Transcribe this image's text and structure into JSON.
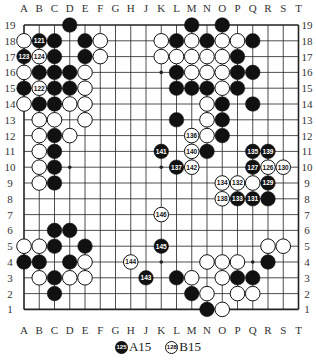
{
  "board": {
    "size": 19,
    "columns": [
      "A",
      "B",
      "C",
      "D",
      "E",
      "F",
      "G",
      "H",
      "J",
      "K",
      "L",
      "M",
      "N",
      "O",
      "P",
      "Q",
      "R",
      "S",
      "T"
    ],
    "rows": [
      19,
      18,
      17,
      16,
      15,
      14,
      13,
      12,
      11,
      10,
      9,
      8,
      7,
      6,
      5,
      4,
      3,
      2,
      1
    ],
    "star_points": [
      "D16",
      "K16",
      "Q16",
      "D10",
      "K10",
      "Q10",
      "D4",
      "K4",
      "Q4"
    ],
    "line_color": "#222222",
    "stones": [
      {
        "pos": "D19",
        "color": "black"
      },
      {
        "pos": "M19",
        "color": "black"
      },
      {
        "pos": "O19",
        "color": "black"
      },
      {
        "pos": "A18",
        "color": "white"
      },
      {
        "pos": "B18",
        "color": "black",
        "label": "121"
      },
      {
        "pos": "C18",
        "color": "black"
      },
      {
        "pos": "E18",
        "color": "black"
      },
      {
        "pos": "F18",
        "color": "white"
      },
      {
        "pos": "K18",
        "color": "white"
      },
      {
        "pos": "L18",
        "color": "black"
      },
      {
        "pos": "M18",
        "color": "white"
      },
      {
        "pos": "N18",
        "color": "black"
      },
      {
        "pos": "O18",
        "color": "white"
      },
      {
        "pos": "P18",
        "color": "white"
      },
      {
        "pos": "Q18",
        "color": "black"
      },
      {
        "pos": "A17",
        "color": "black",
        "label": "123"
      },
      {
        "pos": "B17",
        "color": "white",
        "label": "124"
      },
      {
        "pos": "C17",
        "color": "black"
      },
      {
        "pos": "E17",
        "color": "black"
      },
      {
        "pos": "F17",
        "color": "white"
      },
      {
        "pos": "K17",
        "color": "white"
      },
      {
        "pos": "L17",
        "color": "white"
      },
      {
        "pos": "M17",
        "color": "white"
      },
      {
        "pos": "N17",
        "color": "white"
      },
      {
        "pos": "O17",
        "color": "white"
      },
      {
        "pos": "P17",
        "color": "black"
      },
      {
        "pos": "A16",
        "color": "white"
      },
      {
        "pos": "B16",
        "color": "black"
      },
      {
        "pos": "C16",
        "color": "black"
      },
      {
        "pos": "D16",
        "color": "black"
      },
      {
        "pos": "E16",
        "color": "white"
      },
      {
        "pos": "L16",
        "color": "black"
      },
      {
        "pos": "M16",
        "color": "white"
      },
      {
        "pos": "N16",
        "color": "white"
      },
      {
        "pos": "O16",
        "color": "white"
      },
      {
        "pos": "P16",
        "color": "black"
      },
      {
        "pos": "Q16",
        "color": "black"
      },
      {
        "pos": "A15",
        "color": "black"
      },
      {
        "pos": "B15",
        "color": "white",
        "label": "122"
      },
      {
        "pos": "C15",
        "color": "black"
      },
      {
        "pos": "D15",
        "color": "black"
      },
      {
        "pos": "E15",
        "color": "white"
      },
      {
        "pos": "L15",
        "color": "black"
      },
      {
        "pos": "M15",
        "color": "black"
      },
      {
        "pos": "N15",
        "color": "black"
      },
      {
        "pos": "O15",
        "color": "white"
      },
      {
        "pos": "P15",
        "color": "black"
      },
      {
        "pos": "A14",
        "color": "white"
      },
      {
        "pos": "B14",
        "color": "black"
      },
      {
        "pos": "C14",
        "color": "black"
      },
      {
        "pos": "D14",
        "color": "white"
      },
      {
        "pos": "E14",
        "color": "white"
      },
      {
        "pos": "N14",
        "color": "white"
      },
      {
        "pos": "O14",
        "color": "black"
      },
      {
        "pos": "Q14",
        "color": "black"
      },
      {
        "pos": "B13",
        "color": "white"
      },
      {
        "pos": "C13",
        "color": "white"
      },
      {
        "pos": "E13",
        "color": "white"
      },
      {
        "pos": "L13",
        "color": "black"
      },
      {
        "pos": "N13",
        "color": "white"
      },
      {
        "pos": "O13",
        "color": "black"
      },
      {
        "pos": "B12",
        "color": "white"
      },
      {
        "pos": "C12",
        "color": "black"
      },
      {
        "pos": "D12",
        "color": "white"
      },
      {
        "pos": "M12",
        "color": "white",
        "label": "136"
      },
      {
        "pos": "N12",
        "color": "white"
      },
      {
        "pos": "O12",
        "color": "black"
      },
      {
        "pos": "B11",
        "color": "white"
      },
      {
        "pos": "C11",
        "color": "black"
      },
      {
        "pos": "K11",
        "color": "black",
        "label": "141"
      },
      {
        "pos": "M11",
        "color": "white",
        "label": "140"
      },
      {
        "pos": "N11",
        "color": "black"
      },
      {
        "pos": "Q11",
        "color": "black",
        "label": "135"
      },
      {
        "pos": "R11",
        "color": "black",
        "label": "139"
      },
      {
        "pos": "B10",
        "color": "white"
      },
      {
        "pos": "C10",
        "color": "black"
      },
      {
        "pos": "L10",
        "color": "black",
        "label": "137"
      },
      {
        "pos": "M10",
        "color": "white",
        "label": "142"
      },
      {
        "pos": "Q10",
        "color": "black",
        "label": "127"
      },
      {
        "pos": "R10",
        "color": "white",
        "label": "126"
      },
      {
        "pos": "S10",
        "color": "white",
        "label": "130"
      },
      {
        "pos": "B9",
        "color": "white"
      },
      {
        "pos": "C9",
        "color": "black"
      },
      {
        "pos": "O9",
        "color": "white",
        "label": "134"
      },
      {
        "pos": "P9",
        "color": "white",
        "label": "132"
      },
      {
        "pos": "Q9",
        "color": "white"
      },
      {
        "pos": "R9",
        "color": "black",
        "label": "129"
      },
      {
        "pos": "O8",
        "color": "white",
        "label": "138"
      },
      {
        "pos": "P8",
        "color": "black",
        "label": "133"
      },
      {
        "pos": "Q8",
        "color": "black",
        "label": "131"
      },
      {
        "pos": "R8",
        "color": "black"
      },
      {
        "pos": "K7",
        "color": "white",
        "label": "146"
      },
      {
        "pos": "C6",
        "color": "black"
      },
      {
        "pos": "D6",
        "color": "black"
      },
      {
        "pos": "A5",
        "color": "white"
      },
      {
        "pos": "B5",
        "color": "white"
      },
      {
        "pos": "C5",
        "color": "black"
      },
      {
        "pos": "E5",
        "color": "black"
      },
      {
        "pos": "K5",
        "color": "black",
        "label": "145"
      },
      {
        "pos": "R5",
        "color": "white"
      },
      {
        "pos": "S5",
        "color": "white"
      },
      {
        "pos": "A4",
        "color": "black"
      },
      {
        "pos": "B4",
        "color": "black"
      },
      {
        "pos": "D4",
        "color": "black"
      },
      {
        "pos": "E4",
        "color": "white"
      },
      {
        "pos": "H4",
        "color": "white",
        "label": "144"
      },
      {
        "pos": "N4",
        "color": "white"
      },
      {
        "pos": "O4",
        "color": "white"
      },
      {
        "pos": "P4",
        "color": "white"
      },
      {
        "pos": "R4",
        "color": "black"
      },
      {
        "pos": "B3",
        "color": "white"
      },
      {
        "pos": "C3",
        "color": "black"
      },
      {
        "pos": "D3",
        "color": "white"
      },
      {
        "pos": "E3",
        "color": "white"
      },
      {
        "pos": "J3",
        "color": "black",
        "label": "143"
      },
      {
        "pos": "L3",
        "color": "black"
      },
      {
        "pos": "M3",
        "color": "white"
      },
      {
        "pos": "O3",
        "color": "white"
      },
      {
        "pos": "P3",
        "color": "black"
      },
      {
        "pos": "Q3",
        "color": "black"
      },
      {
        "pos": "C2",
        "color": "black"
      },
      {
        "pos": "M2",
        "color": "black"
      },
      {
        "pos": "N2",
        "color": "white"
      },
      {
        "pos": "P2",
        "color": "white"
      },
      {
        "pos": "Q2",
        "color": "white"
      },
      {
        "pos": "N1",
        "color": "black"
      },
      {
        "pos": "O1",
        "color": "white"
      }
    ]
  },
  "footer": {
    "notes": [
      {
        "move": "125",
        "color": "black",
        "at": "A15"
      },
      {
        "move": "128",
        "color": "white",
        "at": "B15"
      }
    ]
  }
}
